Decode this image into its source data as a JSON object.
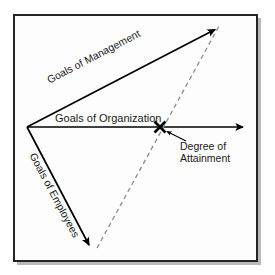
{
  "figure": {
    "type": "concept-diagram",
    "background_color": "#fdfdfd",
    "frame_color": "#242424",
    "shadow_color": "#b9b9b9",
    "stroke_color": "#000000",
    "dashed_color": "#8c8c8c",
    "text_color": "#1a1a1a"
  },
  "labels": {
    "management": "Goals of Management",
    "organization": "Goals of Organization",
    "employees": "Goals of Employees",
    "attainment_line1": "Degree of",
    "attainment_line2": "Attainment"
  },
  "geometry": {
    "origin": {
      "x": 27,
      "y": 127
    },
    "management_tip": {
      "x": 218,
      "y": 27
    },
    "organization_tip": {
      "x": 246,
      "y": 127
    },
    "employees_tip": {
      "x": 90,
      "y": 248
    },
    "attainment_marker": {
      "x": 160,
      "y": 127
    },
    "leader_from": {
      "x": 186,
      "y": 141
    },
    "leader_to": {
      "x": 166,
      "y": 131
    }
  }
}
